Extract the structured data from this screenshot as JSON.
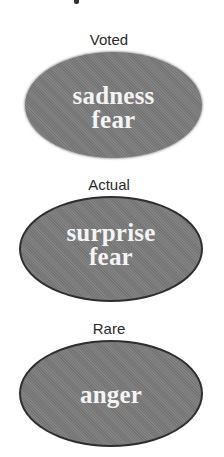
{
  "groups": [
    {
      "label": "Voted",
      "emotions": [
        "sadness",
        "fear"
      ]
    },
    {
      "label": "Actual",
      "emotions": [
        "surprise",
        "fear"
      ]
    },
    {
      "label": "Rare",
      "emotions": [
        "anger"
      ]
    }
  ],
  "colors": {
    "ellipse_fill": "#7b7b7b",
    "ellipse_border": "#2e2e2e",
    "emotion_text": "#f4f4f4",
    "label_text": "#2a2a2a"
  }
}
